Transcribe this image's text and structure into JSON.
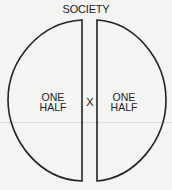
{
  "diagram": {
    "title": "SOCIETY",
    "left_half": {
      "line1": "ONE",
      "line2": "HALF"
    },
    "right_half": {
      "line1": "ONE",
      "line2": "HALF"
    },
    "separator": "X",
    "stroke_color": "#222222",
    "background_color": "#f4f4f2"
  }
}
